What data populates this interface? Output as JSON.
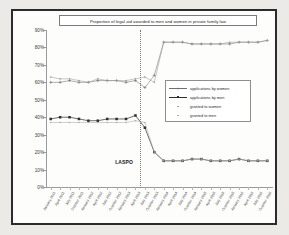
{
  "figure": {
    "title": "Proportion of legal aid awarded to men and women in private family law",
    "annotation_label": "LASPO"
  },
  "chart_data": {
    "type": "line",
    "title": "Proportion of legal aid awarded to men and women in private family law",
    "xlabel": "",
    "ylabel": "",
    "ylim": [
      0,
      90
    ],
    "ytick_labels": [
      "90%",
      "80%",
      "70%",
      "60%",
      "50%",
      "40%",
      "30%",
      "20%",
      "10%",
      "0%"
    ],
    "ytick_values": [
      90,
      80,
      70,
      60,
      50,
      40,
      30,
      20,
      10,
      0
    ],
    "grid": false,
    "legend_position": "center-right",
    "annotations": [
      {
        "label": "LASPO",
        "x_index": 9,
        "type": "vertical-dashed-line"
      }
    ],
    "categories": [
      "January 2011",
      "April 2011",
      "July 2011",
      "October 2011",
      "January 2012",
      "April 2012",
      "July 2012",
      "October 2012",
      "January 2013",
      "April 2013",
      "July 2013",
      "October 2013",
      "January 2014",
      "April 2014",
      "July 2014",
      "October 2014",
      "January 2015",
      "April 2015",
      "July 2015",
      "October 2015",
      "January 2016",
      "April 2016",
      "July 2016",
      "October 2016"
    ],
    "series": [
      {
        "name": "applications by women",
        "marker": "plus",
        "values": [
          60,
          60,
          61,
          60,
          60,
          61,
          61,
          61,
          60,
          61,
          57,
          64,
          83,
          83,
          83,
          82,
          82,
          82,
          82,
          82,
          83,
          83,
          83,
          84
        ]
      },
      {
        "name": "applications by men",
        "marker": "square-filled",
        "values": [
          39,
          40,
          40,
          39,
          38,
          38,
          39,
          39,
          39,
          41,
          34,
          20,
          15,
          15,
          15,
          16,
          16,
          15,
          15,
          15,
          16,
          15,
          15,
          15
        ]
      },
      {
        "name": "granted to women",
        "marker": "dot",
        "values": [
          63,
          62,
          62,
          61,
          60,
          62,
          61,
          61,
          61,
          62,
          63,
          60,
          83,
          83,
          83,
          82,
          82,
          82,
          82,
          83,
          83,
          83,
          83,
          84
        ]
      },
      {
        "name": "granted to men",
        "marker": "dot",
        "values": [
          37,
          37,
          37,
          37,
          37,
          37,
          37,
          37,
          37,
          38,
          37,
          20,
          15,
          15,
          15,
          16,
          16,
          15,
          15,
          15,
          16,
          15,
          15,
          15
        ]
      }
    ]
  },
  "legend": {
    "items": [
      {
        "label": "applications by women"
      },
      {
        "label": "applications by men"
      },
      {
        "label": "granted to women"
      },
      {
        "label": "granted to men"
      }
    ]
  },
  "colors": {
    "series_applications_women": "#6f6f6f",
    "series_applications_men": "#2e2e2e",
    "series_granted_women": "#9a9a9a",
    "series_granted_men": "#a8a8a8",
    "axis": "#9a9a9a",
    "border": "#2b2b2b",
    "background": "#fdfdfc",
    "page_background": "#eceae7"
  }
}
